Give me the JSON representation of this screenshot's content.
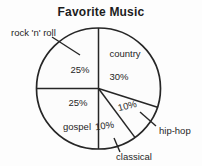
{
  "chart_data": {
    "type": "pie",
    "title": "Favorite Music",
    "start_angle_deg": 0,
    "direction": "clockwise",
    "slices": [
      {
        "label": "country",
        "value": 30,
        "label_placement": "inside"
      },
      {
        "label": "hip-hop",
        "value": 10,
        "label_placement": "outside"
      },
      {
        "label": "classical",
        "value": 10,
        "label_placement": "outside"
      },
      {
        "label": "gospel",
        "value": 25,
        "label_placement": "inside"
      },
      {
        "label": "rock 'n' roll",
        "value": 25,
        "label_placement": "outside"
      }
    ],
    "value_suffix": "%",
    "legend": "none",
    "colors": {
      "slice_fill": "#fcfcfc",
      "stroke": "#262626",
      "text": "#1f1f1f",
      "background": "#fdfdfd"
    }
  }
}
